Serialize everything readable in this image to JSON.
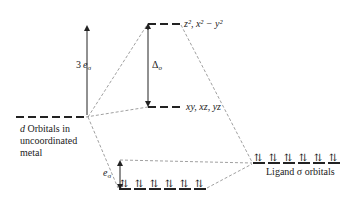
{
  "diagram": {
    "levels": {
      "eg_label": "z², x² − y²",
      "t2g_label": "xy, xz, yz",
      "metal_d_label_line1": "d Orbitals in",
      "metal_d_label_line1_italic": "d",
      "metal_d_label_line1_rest": " Orbitals in",
      "metal_d_label_line2": "uncoordinated",
      "metal_d_label_line3": "metal",
      "ligand_label": "Ligand σ orbitals"
    },
    "arrows": {
      "three_e_sigma_coef": "3",
      "e_sigma_e": "e",
      "e_sigma_sub": "σ",
      "delta_o_symbol": "Δ",
      "delta_o_sub": "o"
    },
    "electron_pair_glyph": "⇅",
    "ligand_orbital_count": 6,
    "bonding_orbital_count": 6
  }
}
